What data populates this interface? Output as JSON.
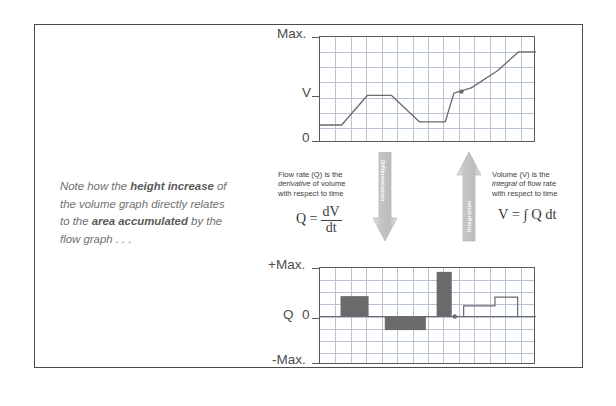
{
  "note": {
    "line1_a": "Note how the ",
    "line1_b": "height increase",
    "line1_c": " of",
    "line2": "the volume graph directly relates",
    "line3_a": "to the ",
    "line3_b": "area accumulated",
    "line3_c": " by the",
    "line4": "flow graph . . ."
  },
  "volume_chart": {
    "y_top_label": "Max.",
    "y_mid_label": "V",
    "y_bottom_label": "0"
  },
  "flow_chart": {
    "y_top_label": "+Max.",
    "y_mid_label_series": "Q",
    "y_mid_label_value": "0",
    "y_bottom_label": "-Max."
  },
  "left_text": {
    "l1": "Flow rate (Q) is the",
    "l2_a": "derivative",
    "l2_b": " of volume",
    "l3": "with respect to time"
  },
  "left_equation": {
    "lhs": "Q =",
    "numerator": "dV",
    "denominator": "dt"
  },
  "right_text": {
    "l1": "Volume (V) is the",
    "l2_a": "integral",
    "l2_b": " of flow rate",
    "l3": "with respect to time"
  },
  "right_equation": {
    "text": "V = ∫ Q dt"
  },
  "arrows": {
    "down_label": "Differentiation",
    "up_label": "Integration"
  },
  "colors": {
    "frame": "#4a4a4a",
    "grid": "#b9c4d2",
    "axis": "#5a5a5a",
    "series": "#6a6a6a",
    "bar_fill": "#6b6b6b",
    "arrow": "#c9c9c9",
    "note_text": "#6f6f6f"
  },
  "chart_data": [
    {
      "type": "line",
      "name": "volume-graph",
      "title": "",
      "xlabel": "",
      "ylabel": "V",
      "ylim": [
        0,
        1
      ],
      "ytick_labels": [
        "0",
        "V",
        "Max."
      ],
      "ytick_values": [
        0,
        0.62,
        1
      ],
      "grid": true,
      "x": [
        0.0,
        0.1,
        0.22,
        0.33,
        0.46,
        0.58,
        0.62,
        0.7,
        0.82,
        0.92,
        1.0
      ],
      "y": [
        0.17,
        0.17,
        0.45,
        0.45,
        0.2,
        0.2,
        0.47,
        0.52,
        0.68,
        0.86,
        0.86
      ],
      "marker_points": [
        {
          "x": 0.655,
          "y": 0.485
        }
      ]
    },
    {
      "type": "bar",
      "name": "flow-rate-graph",
      "title": "",
      "xlabel": "",
      "ylabel": "Q",
      "ylim": [
        -1,
        1
      ],
      "ytick_labels": [
        "-Max.",
        "0",
        "+Max."
      ],
      "ytick_values": [
        -1,
        0,
        1
      ],
      "grid": true,
      "bars": [
        {
          "x0": 0.095,
          "x1": 0.225,
          "value": 0.42
        },
        {
          "x0": 0.3,
          "x1": 0.49,
          "value": -0.28
        },
        {
          "x0": 0.54,
          "x1": 0.61,
          "value": 0.92
        }
      ],
      "step_series": [
        {
          "x0": 0.62,
          "x1": 0.665,
          "value": 0.0
        },
        {
          "x0": 0.665,
          "x1": 0.81,
          "value": 0.22
        },
        {
          "x0": 0.81,
          "x1": 0.915,
          "value": 0.4
        },
        {
          "x0": 0.915,
          "x1": 1.0,
          "value": 0.0
        }
      ],
      "marker_points": [
        {
          "x": 0.624,
          "y": 0.0
        }
      ]
    }
  ]
}
